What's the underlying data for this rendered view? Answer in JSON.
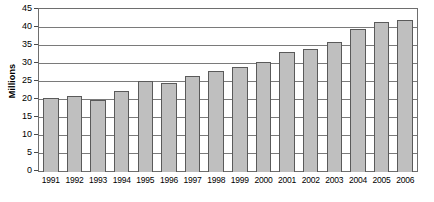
{
  "chart_data": {
    "type": "bar",
    "title": "",
    "xlabel": "",
    "ylabel": "Millions",
    "ylim": [
      0,
      45
    ],
    "ytick_step": 5,
    "yticks": [
      45,
      40,
      35,
      30,
      25,
      20,
      15,
      10,
      5,
      0
    ],
    "grid": true,
    "legend": "none",
    "categories": [
      "1991",
      "1992",
      "1993",
      "1994",
      "1995",
      "1996",
      "1997",
      "1998",
      "1999",
      "2000",
      "2001",
      "2002",
      "2003",
      "2004",
      "2005",
      "2006"
    ],
    "values": [
      20.5,
      21,
      20,
      22.5,
      25,
      24.5,
      26.5,
      28,
      29,
      30.5,
      33,
      34,
      36,
      39.5,
      41.5,
      42
    ],
    "bar_fill_color": "#bfbfbf",
    "bar_border_color": "#5a5a5a",
    "gridline_color": "#7a7a7a",
    "plot_border_color": "#6e6e6e",
    "background_color": "#ffffff"
  }
}
